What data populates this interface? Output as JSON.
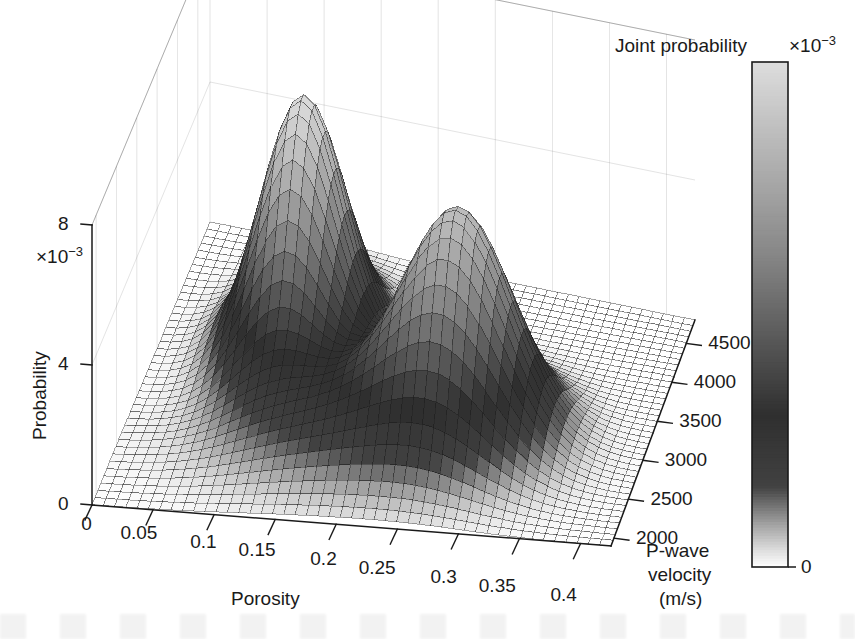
{
  "figure": {
    "kind": "3d-surface-plot",
    "background": "#ffffff",
    "ink": "#1a1a1a"
  },
  "colorbar": {
    "title": "Joint probability",
    "exponent_text": "×10",
    "exponent_sup": "−3",
    "ticks": [
      "7",
      "6",
      "5",
      "4",
      "3",
      "2",
      "1",
      "0"
    ],
    "tick_values": [
      7,
      6,
      5,
      4,
      3,
      2,
      1,
      0
    ],
    "range": [
      0,
      7.5
    ],
    "colormap": "grayscale-inverted",
    "low_color": "#ffffff",
    "high_color": "#d9d9d9",
    "mid_color": "#3a3a3a"
  },
  "axes": {
    "z": {
      "label": "Probability",
      "exponent_text": "×10",
      "exponent_sup": "−3",
      "ticks": [
        "8",
        "4",
        "0"
      ],
      "tick_values": [
        8,
        4,
        0
      ],
      "range": [
        0,
        8
      ]
    },
    "x": {
      "label": "Porosity",
      "ticks": [
        "0",
        "0.05",
        "0.1",
        "0.15",
        "0.2",
        "0.25",
        "0.3",
        "0.35",
        "0.4"
      ],
      "tick_values": [
        0,
        0.05,
        0.1,
        0.15,
        0.2,
        0.25,
        0.3,
        0.35,
        0.4
      ],
      "range": [
        0,
        0.425
      ]
    },
    "y": {
      "label_lines": [
        "P-wave",
        "velocity",
        "(m/s)"
      ],
      "ticks": [
        "4500",
        "4000",
        "3500",
        "3000",
        "2500",
        "2000"
      ],
      "tick_values": [
        4500,
        4000,
        3500,
        3000,
        2500,
        2000
      ],
      "range": [
        1900,
        4800
      ]
    }
  },
  "chart_data": {
    "type": "surface",
    "title": "Joint probability",
    "xlabel": "Porosity",
    "ylabel": "P-wave velocity (m/s)",
    "zlabel": "Probability",
    "z_scale": 0.001,
    "colorbar_label": "Joint probability",
    "colorbar_scale": 0.001,
    "xlim": [
      0,
      0.425
    ],
    "ylim": [
      1900,
      4800
    ],
    "zlim": [
      0,
      0.008
    ],
    "clim": [
      0,
      0.0075
    ],
    "grid": true,
    "legend": "none",
    "modes": [
      {
        "name": "mode-1",
        "x_porosity": 0.12,
        "y_velocity": 3600,
        "peak_probability": 0.0075,
        "sigma_x": 0.035,
        "sigma_y": 420
      },
      {
        "name": "mode-2",
        "x_porosity": 0.27,
        "y_velocity": 3050,
        "peak_probability": 0.006,
        "sigma_x": 0.045,
        "sigma_y": 380
      },
      {
        "name": "ridge-3",
        "x_porosity": 0.2,
        "y_velocity": 2600,
        "peak_probability": 0.0018,
        "sigma_x": 0.075,
        "sigma_y": 330
      }
    ],
    "grid_nx": 46,
    "grid_ny": 40
  }
}
